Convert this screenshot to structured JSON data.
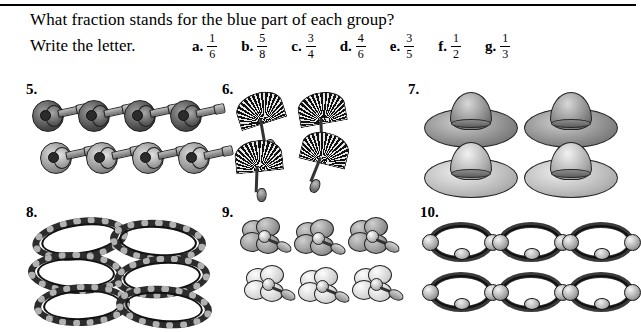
{
  "worksheet": {
    "instruction_line1": "What fraction stands for the blue part of each group?",
    "instruction_line2": "Write the letter."
  },
  "choices": [
    {
      "letter": "a.",
      "numerator": "1",
      "denominator": "6"
    },
    {
      "letter": "b.",
      "numerator": "5",
      "denominator": "8"
    },
    {
      "letter": "c.",
      "numerator": "3",
      "denominator": "4"
    },
    {
      "letter": "d.",
      "numerator": "4",
      "denominator": "6"
    },
    {
      "letter": "e.",
      "numerator": "3",
      "denominator": "5"
    },
    {
      "letter": "f.",
      "numerator": "1",
      "denominator": "2"
    },
    {
      "letter": "g.",
      "numerator": "1",
      "denominator": "3"
    }
  ],
  "problems": [
    {
      "number": "5.",
      "object": "guitar",
      "count": 8,
      "shaded": 4
    },
    {
      "number": "6.",
      "object": "fan",
      "count": 4,
      "shaded": 2
    },
    {
      "number": "7.",
      "object": "sombrero",
      "count": 4,
      "shaded": 2
    },
    {
      "number": "8.",
      "object": "rope",
      "count": 6,
      "shaded": 3
    },
    {
      "number": "9.",
      "object": "flower",
      "count": 6,
      "shaded": 3
    },
    {
      "number": "10.",
      "object": "maraca",
      "count": 6,
      "shaded": 3
    }
  ],
  "colors": {
    "ink": "#000000",
    "rule": "#000000",
    "page": "#ffffff"
  }
}
